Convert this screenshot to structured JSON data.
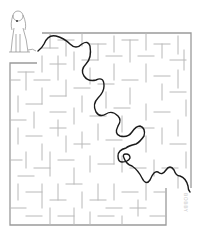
{
  "puzzle": {
    "type": "maze",
    "start_character": "dog-icon",
    "signature_text": "BOBBY",
    "colors": {
      "background": "#ffffff",
      "walls": "#b8b8b8",
      "border": "#9a9a9a",
      "solution_path": "#1a1a1a"
    },
    "maze_bounds": {
      "left": 10,
      "top": 33,
      "right": 193,
      "bottom": 225
    },
    "entrance": "top-left (beside dog)",
    "exit": "bottom-right notch",
    "solution_shown": true
  }
}
